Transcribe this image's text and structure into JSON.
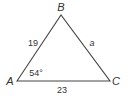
{
  "figure": {
    "type": "triangle",
    "stroke_color": "#444444",
    "vertices": {
      "A": {
        "label": "A",
        "x": 17,
        "y": 81
      },
      "B": {
        "label": "B",
        "x": 61,
        "y": 15
      },
      "C": {
        "label": "C",
        "x": 110,
        "y": 81
      }
    },
    "sides": {
      "AB": {
        "label": "19"
      },
      "BC": {
        "label": "a"
      },
      "AC": {
        "label": "23"
      }
    },
    "angles": {
      "A": {
        "label": "54°"
      }
    }
  }
}
